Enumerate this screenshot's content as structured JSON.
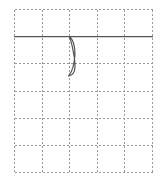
{
  "chart_data": {
    "type": "line",
    "title": "",
    "subtitle": "",
    "xlabel": "",
    "ylabel": "",
    "grid": true,
    "legend": false,
    "legend_position": "none",
    "background_color": "#ffffff",
    "trace_color": "#555555",
    "grid_color": "#9a9a9a",
    "grid_style": "dashed",
    "xlim": [
      0,
      5
    ],
    "ylim": [
      0,
      6
    ],
    "x_tick_labels": [],
    "y_tick_labels": [],
    "x_gridlines": [
      0,
      1,
      2,
      3,
      4,
      5
    ],
    "y_gridlines": [
      0,
      1,
      2,
      3,
      4,
      5,
      6
    ],
    "baseline_y": 5,
    "series": [
      {
        "name": "trace",
        "color": "#555555",
        "points": [
          [
            0.0,
            5.0
          ],
          [
            1.9,
            5.0
          ],
          [
            1.98,
            5.0
          ],
          [
            2.02,
            4.92
          ],
          [
            2.08,
            4.7
          ],
          [
            2.13,
            4.45
          ],
          [
            2.17,
            4.22
          ],
          [
            2.19,
            4.02
          ],
          [
            2.19,
            3.86
          ],
          [
            2.17,
            3.74
          ],
          [
            2.13,
            3.66
          ],
          [
            2.07,
            3.6
          ],
          [
            2.01,
            3.57
          ],
          [
            1.97,
            3.55
          ],
          [
            1.96,
            3.56
          ],
          [
            2.0,
            3.62
          ],
          [
            2.06,
            3.72
          ],
          [
            2.12,
            3.88
          ],
          [
            2.16,
            4.08
          ],
          [
            2.19,
            4.32
          ],
          [
            2.18,
            4.56
          ],
          [
            2.14,
            4.76
          ],
          [
            2.08,
            4.9
          ],
          [
            2.02,
            4.97
          ],
          [
            1.99,
            5.0
          ],
          [
            2.1,
            5.0
          ],
          [
            3.0,
            5.0
          ],
          [
            4.0,
            5.0
          ],
          [
            5.0,
            5.0
          ]
        ]
      }
    ],
    "annotations": []
  },
  "plot": {
    "region_name": "waveform-plot-area"
  }
}
